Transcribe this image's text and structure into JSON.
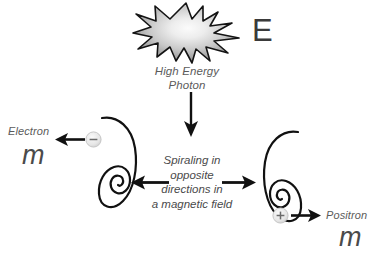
{
  "diagram": {
    "background_color": "#ffffff",
    "photon": {
      "burst_icon": "starburst-icon",
      "energy_symbol": "E",
      "caption": "High Energy\nPhoton"
    },
    "center": {
      "caption": "Spiraling in\nopposite\ndirections in\na magnetic field",
      "arrow_left_icon": "arrow-left-icon",
      "arrow_right_icon": "arrow-right-icon",
      "arrow_down_icon": "arrow-down-icon"
    },
    "electron": {
      "label": "Electron",
      "mass_symbol": "m",
      "charge_sign": "−",
      "particle_icon": "electron-particle-icon",
      "spiral_icon": "spiral-left-icon",
      "arrow_icon": "arrow-left-icon"
    },
    "positron": {
      "label": "Positron",
      "mass_symbol": "m",
      "charge_sign": "+",
      "particle_icon": "positron-particle-icon",
      "spiral_icon": "spiral-right-icon",
      "arrow_icon": "arrow-right-icon"
    },
    "colors": {
      "ink": "#111111",
      "text_gray": "#5b5b5b",
      "burst_outline": "#141414",
      "burst_center": "#f2f2f2",
      "burst_edge": "#8e8e8e",
      "particle_fill": "#e8e8e8"
    }
  }
}
